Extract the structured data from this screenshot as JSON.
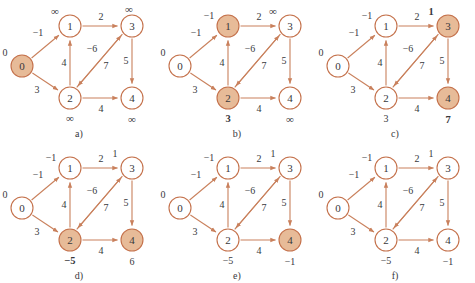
{
  "figure": {
    "colors": {
      "edge": "#c9805c",
      "node_stroke": "#c4714b",
      "node_fill": "#ffffff",
      "node_highlight_fill": "#e7bb98",
      "text": "#38383c",
      "background": "#ffffff"
    },
    "graph": {
      "nodes": [
        {
          "id": "0",
          "label": "0",
          "x": 22,
          "y": 66
        },
        {
          "id": "1",
          "label": "1",
          "x": 70,
          "y": 26
        },
        {
          "id": "2",
          "label": "2",
          "x": 70,
          "y": 98
        },
        {
          "id": "3",
          "label": "3",
          "x": 132,
          "y": 26
        },
        {
          "id": "4",
          "label": "4",
          "x": 132,
          "y": 98
        }
      ],
      "edges": [
        {
          "from": "0",
          "to": "1",
          "weight": "−1"
        },
        {
          "from": "0",
          "to": "2",
          "weight": "3"
        },
        {
          "from": "1",
          "to": "3",
          "weight": "2"
        },
        {
          "from": "2",
          "to": "1",
          "weight": "4"
        },
        {
          "from": "3",
          "to": "2",
          "weight": "−6"
        },
        {
          "from": "2",
          "to": "3",
          "weight": "7"
        },
        {
          "from": "3",
          "to": "4",
          "weight": "5"
        },
        {
          "from": "2",
          "to": "4",
          "weight": "4"
        }
      ]
    },
    "panels": [
      {
        "caption": "a)",
        "distances": {
          "0": "0",
          "1": "∞",
          "2": "∞",
          "3": "∞",
          "4": "∞"
        },
        "bold": {
          "0": false,
          "1": false,
          "2": false,
          "3": false,
          "4": false
        },
        "highlighted": [
          "0"
        ]
      },
      {
        "caption": "b)",
        "distances": {
          "0": "0",
          "1": "−1",
          "2": "3",
          "3": "∞",
          "4": "∞"
        },
        "bold": {
          "0": false,
          "1": false,
          "2": true,
          "3": false,
          "4": false
        },
        "highlighted": [
          "1",
          "2"
        ]
      },
      {
        "caption": "c)",
        "distances": {
          "0": "0",
          "1": "−1",
          "2": "3",
          "3": "1",
          "4": "7"
        },
        "bold": {
          "0": false,
          "1": false,
          "2": false,
          "3": true,
          "4": true
        },
        "highlighted": [
          "3",
          "4"
        ]
      },
      {
        "caption": "d)",
        "distances": {
          "0": "0",
          "1": "−1",
          "2": "−5",
          "3": "1",
          "4": "6"
        },
        "bold": {
          "0": false,
          "1": false,
          "2": true,
          "3": false,
          "4": false
        },
        "highlighted": [
          "2",
          "4"
        ]
      },
      {
        "caption": "e)",
        "distances": {
          "0": "0",
          "1": "−1",
          "2": "−5",
          "3": "1",
          "4": "−1"
        },
        "bold": {
          "0": false,
          "1": false,
          "2": false,
          "3": false,
          "4": false
        },
        "highlighted": [
          "4"
        ]
      },
      {
        "caption": "f)",
        "distances": {
          "0": "0",
          "1": "−1",
          "2": "−5",
          "3": "1",
          "4": "−1"
        },
        "bold": {
          "0": false,
          "1": false,
          "2": false,
          "3": false,
          "4": false
        },
        "highlighted": []
      }
    ]
  }
}
